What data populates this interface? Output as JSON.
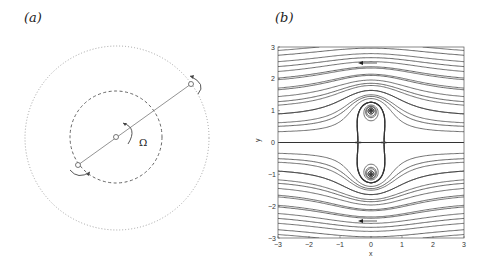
{
  "panels": {
    "a": {
      "label": "(a)",
      "omega_label": "Ω",
      "outer_circle": {
        "style": "dotted"
      },
      "inner_circle": {
        "style": "dashed"
      },
      "rod": {
        "points": 3
      }
    },
    "b": {
      "label": "(b)",
      "xlabel": "x",
      "ylabel": "y",
      "xticks": [
        "-3",
        "-2",
        "-1",
        "0",
        "1",
        "2",
        "3"
      ],
      "yticks": [
        "3",
        "2",
        "1",
        "0",
        "-1",
        "-2",
        "-3"
      ]
    }
  },
  "chart_data": {
    "type": "streamline",
    "title": "",
    "xlabel": "x",
    "ylabel": "y",
    "xlim": [
      -3,
      3
    ],
    "ylim": [
      -3,
      3
    ],
    "xticks": [
      -3,
      -2,
      -1,
      0,
      1,
      2,
      3
    ],
    "yticks": [
      -3,
      -2,
      -1,
      0,
      1,
      2,
      3
    ],
    "grid": false,
    "features": {
      "vortex_centers": [
        [
          0,
          1
        ],
        [
          0,
          -1
        ]
      ],
      "separatrix_half_width_x": 1.7,
      "separatrix_height_y": 2.1,
      "stagnation_points": [
        [
          -1.7,
          0
        ],
        [
          1.7,
          0
        ]
      ],
      "flow_direction_arrows": [
        {
          "x": 0,
          "y": 2.5,
          "dir": "left"
        },
        {
          "x": 0,
          "y": -2.5,
          "dir": "left"
        }
      ]
    }
  }
}
